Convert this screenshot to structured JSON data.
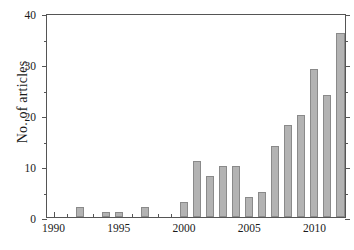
{
  "chart_data": {
    "type": "bar",
    "title": "",
    "subtitle": "",
    "xlabel": "",
    "ylabel": "No. of articles",
    "categories": [
      1990,
      1991,
      1992,
      1993,
      1994,
      1995,
      1996,
      1997,
      1998,
      1999,
      2000,
      2001,
      2002,
      2003,
      2004,
      2005,
      2006,
      2007,
      2008,
      2009,
      2010,
      2011,
      2012
    ],
    "values": [
      0,
      0,
      2,
      0,
      1,
      1,
      0,
      2,
      0,
      0,
      3,
      11,
      8,
      10,
      10,
      4,
      5,
      14,
      18,
      20,
      29,
      24,
      36
    ],
    "series": [
      {
        "name": "No. of articles",
        "values": [
          0,
          0,
          2,
          0,
          1,
          1,
          0,
          2,
          0,
          0,
          3,
          11,
          8,
          10,
          10,
          4,
          5,
          14,
          18,
          20,
          29,
          24,
          36
        ]
      }
    ],
    "xlim": [
      1989.5,
      2012.5
    ],
    "ylim": [
      0,
      40
    ],
    "y_major_ticks": [
      0,
      10,
      20,
      30,
      40
    ],
    "y_minor_ticks": [
      5,
      15,
      25,
      35
    ],
    "y_tick_labels": [
      "0",
      "10",
      "20",
      "30",
      "40"
    ],
    "x_major_ticks": [
      1990,
      1995,
      2000,
      2005,
      2010
    ],
    "x_minor_ticks": [
      1991,
      1992,
      1993,
      1994,
      1996,
      1997,
      1998,
      1999,
      2001,
      2002,
      2003,
      2004,
      2006,
      2007,
      2008,
      2009,
      2011,
      2012
    ],
    "x_tick_labels": [
      "1990",
      "1995",
      "2000",
      "2005",
      "2010"
    ],
    "grid": false,
    "legend": false,
    "legend_position": "none",
    "bar_color": "#b3b3b3",
    "bar_edge_color": "#8a8a8a",
    "axis_color": "#555555",
    "text_color": "#1a1a1a",
    "background_color": "#ffffff"
  }
}
